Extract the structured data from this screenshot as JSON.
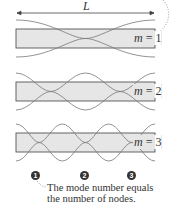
{
  "diagram": {
    "length_label": "L",
    "modes": [
      {
        "m_label": "m",
        "eq": " = ",
        "value": "1",
        "nodes": 1
      },
      {
        "m_label": "m",
        "eq": " = ",
        "value": "2",
        "nodes": 2
      },
      {
        "m_label": "m",
        "eq": " = ",
        "value": "3",
        "nodes": 3
      }
    ],
    "node_numbers": [
      "1",
      "2",
      "3"
    ],
    "annotation": {
      "line1": "The mode number equals",
      "line2": "the number of nodes."
    },
    "colors": {
      "box_fill": "#e6e6e6",
      "box_stroke": "#555555",
      "wave_stroke": "#777777",
      "text": "#333333"
    }
  }
}
